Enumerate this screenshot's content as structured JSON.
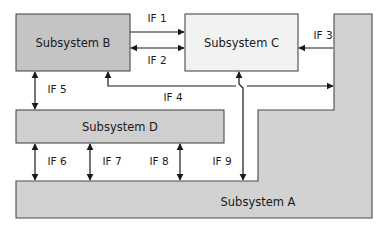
{
  "diagram": {
    "colors": {
      "subsystem_a_fill": "#d2d2d2",
      "subsystem_b_fill": "#c4c4c4",
      "subsystem_c_fill": "#f2f2f2",
      "subsystem_d_fill": "#cfcfcf",
      "shape_border": "#4a4a4a",
      "connector": "#1a1a1a",
      "background": "#ffffff"
    },
    "blocks": [
      {
        "id": "subsystem-a",
        "label": "Subsystem A",
        "shape": "l-shape",
        "fill": "#d2d2d2"
      },
      {
        "id": "subsystem-b",
        "label": "Subsystem B",
        "shape": "rect",
        "fill": "#c4c4c4"
      },
      {
        "id": "subsystem-c",
        "label": "Subsystem C",
        "shape": "rect",
        "fill": "#f2f2f2"
      },
      {
        "id": "subsystem-d",
        "label": "Subsystem D",
        "shape": "rect",
        "fill": "#cfcfcf"
      }
    ],
    "interfaces": [
      {
        "id": "if-1",
        "label": "IF 1",
        "from": "Subsystem B",
        "to": "Subsystem C",
        "direction": "unidirectional"
      },
      {
        "id": "if-2",
        "label": "IF 2",
        "from": "Subsystem B",
        "to": "Subsystem C",
        "direction": "bidirectional"
      },
      {
        "id": "if-3",
        "label": "IF 3",
        "from": "Subsystem A",
        "to": "Subsystem C",
        "direction": "unidirectional"
      },
      {
        "id": "if-4",
        "label": "IF 4",
        "from": "Subsystem B",
        "to": "Subsystem A",
        "direction": "unidirectional"
      },
      {
        "id": "if-5",
        "label": "IF 5",
        "from": "Subsystem B",
        "to": "Subsystem D",
        "direction": "bidirectional"
      },
      {
        "id": "if-6",
        "label": "IF 6",
        "from": "Subsystem D",
        "to": "Subsystem A",
        "direction": "bidirectional"
      },
      {
        "id": "if-7",
        "label": "IF 7",
        "from": "Subsystem D",
        "to": "Subsystem A",
        "direction": "bidirectional"
      },
      {
        "id": "if-8",
        "label": "IF 8",
        "from": "Subsystem D",
        "to": "Subsystem A",
        "direction": "bidirectional"
      },
      {
        "id": "if-9",
        "label": "IF 9",
        "from": "Subsystem C",
        "to": "Subsystem A",
        "direction": "bidirectional"
      }
    ]
  }
}
